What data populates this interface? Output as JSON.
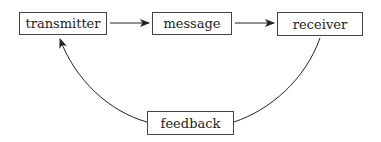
{
  "diagram": {
    "type": "communication-cycle",
    "nodes": {
      "transmitter": {
        "label": "transmitter"
      },
      "message": {
        "label": "message"
      },
      "receiver": {
        "label": "receiver"
      },
      "feedback": {
        "label": "feedback"
      }
    },
    "edges": [
      {
        "from": "transmitter",
        "to": "message",
        "style": "straight-arrow"
      },
      {
        "from": "message",
        "to": "receiver",
        "style": "straight-arrow"
      },
      {
        "from": "receiver",
        "to": "feedback",
        "style": "curved-line"
      },
      {
        "from": "feedback",
        "to": "transmitter",
        "style": "curved-arrow"
      }
    ],
    "colors": {
      "stroke": "#222222",
      "box_border": "#444444",
      "text": "#222222"
    }
  }
}
